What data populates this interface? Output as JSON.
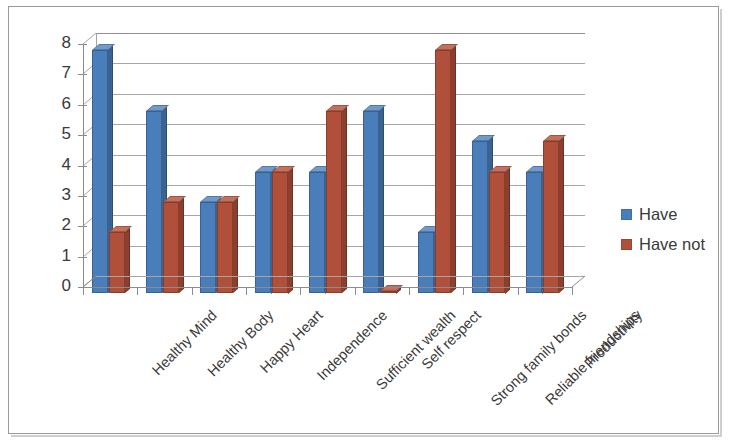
{
  "chart_data": {
    "type": "bar",
    "title": "",
    "xlabel": "",
    "ylabel": "",
    "ylim": [
      0,
      8
    ],
    "ytick_labels": [
      "0",
      "1",
      "2",
      "3",
      "4",
      "5",
      "6",
      "7",
      "8"
    ],
    "grid": true,
    "legend_position": "right",
    "style": "3d-clustered-column",
    "categories": [
      "Healthy Mind",
      "Healthy Body",
      "Happy Heart",
      "Independence",
      "Sufficient wealth",
      "Self respect",
      "Strong family bonds",
      "Reliable friendships",
      "Productivity"
    ],
    "series": [
      {
        "name": "Have",
        "color": "#4a7ebb",
        "side_color": "#3a648f",
        "top_color": "#6f9acb",
        "values": [
          8,
          6,
          3,
          4,
          4,
          6,
          2,
          5,
          4
        ]
      },
      {
        "name": "Have not",
        "color": "#b0503a",
        "side_color": "#8c3f2e",
        "top_color": "#c4705c",
        "values": [
          2,
          3,
          3,
          4,
          6,
          0,
          8,
          4,
          5
        ]
      }
    ]
  },
  "legend": {
    "items": [
      {
        "label": "Have",
        "color": "#4a7ebb"
      },
      {
        "label": "Have not",
        "color": "#b0503a"
      }
    ]
  },
  "colors": {
    "series_have": "#4a7ebb",
    "series_have_not": "#b0503a",
    "gridline": "#a6a6a6",
    "axis": "#8c8c8c",
    "text": "#3a3a3a",
    "frame": "#9a9a9a",
    "background": "#ffffff"
  }
}
